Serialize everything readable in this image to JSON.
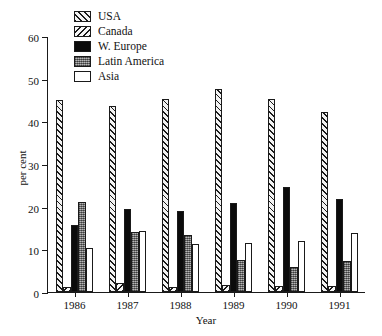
{
  "chart_data": {
    "type": "bar",
    "title": "",
    "subtitle": "",
    "xlabel": "Year",
    "ylabel": "per cent",
    "categories": [
      "1986",
      "1987",
      "1988",
      "1989",
      "1990",
      "1991"
    ],
    "ylim": [
      0,
      60
    ],
    "yticks": [
      0,
      10,
      20,
      30,
      40,
      50,
      60
    ],
    "ytick_labels": [
      "0",
      "10",
      "20",
      "30",
      "40",
      "50",
      "60"
    ],
    "grid": false,
    "legend_position": "top-left-inside",
    "series": [
      {
        "name": "USA",
        "color": "#f2f2f2",
        "pattern": "diagonal-hatch-right",
        "values": [
          45.0,
          43.5,
          45.3,
          47.5,
          45.2,
          42.3
        ]
      },
      {
        "name": "Canada",
        "color": "#f7f7f7",
        "pattern": "diagonal-hatch-left",
        "values": [
          1.2,
          2.0,
          1.2,
          1.6,
          1.5,
          1.5
        ]
      },
      {
        "name": "W. Europe",
        "color": "#0b0b0b",
        "pattern": "solid-black",
        "values": [
          15.6,
          19.5,
          19.0,
          20.8,
          24.5,
          21.7
        ]
      },
      {
        "name": "Latin America",
        "color": "#8e8e8e",
        "pattern": "stipple-gray",
        "values": [
          21.0,
          14.0,
          13.3,
          7.5,
          5.8,
          7.2
        ]
      },
      {
        "name": "Asia",
        "color": "#ffffff",
        "pattern": "open-white",
        "values": [
          10.2,
          14.2,
          11.3,
          11.6,
          12.0,
          13.8
        ]
      }
    ]
  },
  "legend": {
    "items": [
      {
        "label": "USA"
      },
      {
        "label": "Canada"
      },
      {
        "label": "W. Europe"
      },
      {
        "label": "Latin America"
      },
      {
        "label": "Asia"
      }
    ]
  }
}
